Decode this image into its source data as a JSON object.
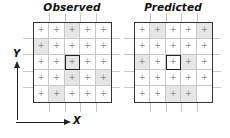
{
  "panels": [
    {
      "id": "observed",
      "title": "Observed",
      "rows": 5,
      "cols": 5,
      "focus_cell": [
        2,
        2
      ],
      "cells": [
        [
          {
            "mark": "+",
            "shaded": false
          },
          {
            "mark": "+",
            "shaded": false
          },
          {
            "mark": "+",
            "shaded": true
          },
          {
            "mark": "+",
            "shaded": false
          },
          {
            "mark": "+",
            "shaded": false
          }
        ],
        [
          {
            "mark": "+",
            "shaded": true
          },
          {
            "mark": "+",
            "shaded": false
          },
          {
            "mark": "+",
            "shaded": false
          },
          {
            "mark": "+",
            "shaded": false
          },
          {
            "mark": "+",
            "shaded": false
          }
        ],
        [
          {
            "mark": "+",
            "shaded": false
          },
          {
            "mark": "+",
            "shaded": false
          },
          {
            "mark": "+",
            "shaded": true
          },
          {
            "mark": "+",
            "shaded": false
          },
          {
            "mark": "+",
            "shaded": false
          }
        ],
        [
          {
            "mark": "+",
            "shaded": false
          },
          {
            "mark": "+",
            "shaded": false
          },
          {
            "mark": "+",
            "shaded": true
          },
          {
            "mark": "+",
            "shaded": false
          },
          {
            "mark": "+",
            "shaded": true
          }
        ],
        [
          {
            "mark": "+",
            "shaded": false
          },
          {
            "mark": "+",
            "shaded": true
          },
          {
            "mark": "+",
            "shaded": false
          },
          {
            "mark": "+",
            "shaded": false
          },
          {
            "mark": "+",
            "shaded": false
          }
        ]
      ]
    },
    {
      "id": "predicted",
      "title": "Predicted",
      "rows": 5,
      "cols": 5,
      "focus_cell": [
        2,
        2
      ],
      "cells": [
        [
          {
            "mark": "+",
            "shaded": false
          },
          {
            "mark": "+",
            "shaded": true
          },
          {
            "mark": "+",
            "shaded": false
          },
          {
            "mark": "+",
            "shaded": false
          },
          {
            "mark": "+",
            "shaded": true
          }
        ],
        [
          {
            "mark": "+",
            "shaded": false
          },
          {
            "mark": "+",
            "shaded": false
          },
          {
            "mark": "+",
            "shaded": false
          },
          {
            "mark": "+",
            "shaded": false
          },
          {
            "mark": "+",
            "shaded": false
          }
        ],
        [
          {
            "mark": "+",
            "shaded": true
          },
          {
            "mark": "+",
            "shaded": false
          },
          {
            "mark": "+",
            "shaded": false
          },
          {
            "mark": "+",
            "shaded": true
          },
          {
            "mark": "+",
            "shaded": false
          }
        ],
        [
          {
            "mark": "+",
            "shaded": false
          },
          {
            "mark": "+",
            "shaded": false
          },
          {
            "mark": "+",
            "shaded": false
          },
          {
            "mark": "+",
            "shaded": false
          },
          {
            "mark": "+",
            "shaded": false
          }
        ],
        [
          {
            "mark": "+",
            "shaded": false
          },
          {
            "mark": "+",
            "shaded": false
          },
          {
            "mark": "+",
            "shaded": true
          },
          {
            "mark": "+",
            "shaded": true
          },
          {
            "mark": "",
            "shaded": false
          }
        ]
      ]
    }
  ],
  "axes": {
    "x_label": "X",
    "y_label": "Y"
  },
  "colors": {
    "shaded_cell": "#e6e6e6",
    "grid_line": "#c8c8c8",
    "border": "#333333",
    "mark": "#888888"
  }
}
